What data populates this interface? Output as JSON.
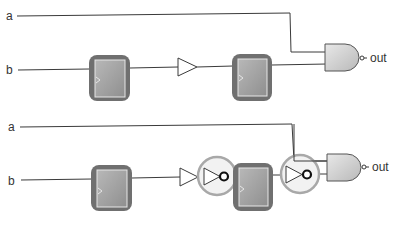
{
  "colors": {
    "wire": "#3a3a3a",
    "label": "#333333",
    "ff_outer": "#6e6e6e",
    "ff_inner": "#a9a9a9",
    "ff_inner_border": "#e6e6e6",
    "gate_fill": "#d4d4d4",
    "highlight_ring": "#a8a8a8",
    "highlight_fill": "#f2f2f2"
  },
  "circuits": [
    {
      "name": "original",
      "inputs": [
        {
          "label": "a"
        },
        {
          "label": "b"
        }
      ],
      "output": {
        "label": "out"
      },
      "components": [
        "flip-flop",
        "buffer",
        "flip-flop",
        "nand-gate"
      ]
    },
    {
      "name": "retimed",
      "inputs": [
        {
          "label": "a"
        },
        {
          "label": "b"
        }
      ],
      "output": {
        "label": "out"
      },
      "components": [
        "flip-flop",
        "buffer",
        "inverter-highlighted",
        "flip-flop",
        "inverter-highlighted",
        "nand-gate"
      ]
    }
  ]
}
